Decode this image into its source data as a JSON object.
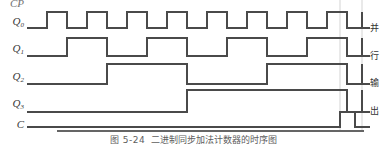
{
  "figure": {
    "caption_number": "图 5-24",
    "caption_text": "二进制同步加法计数器的时序图",
    "background_color": "#ffffff",
    "line_color": "#4a4a4a",
    "guide_color": "#c8c8c8"
  },
  "left_labels": [
    {
      "name": "CP",
      "base": "CP",
      "sub": "",
      "clipped": true
    },
    {
      "name": "Q0",
      "base": "Q",
      "sub": "0",
      "clipped": false
    },
    {
      "name": "Q1",
      "base": "Q",
      "sub": "1",
      "clipped": false
    },
    {
      "name": "Q2",
      "base": "Q",
      "sub": "2",
      "clipped": false
    },
    {
      "name": "Q3",
      "base": "Q",
      "sub": "3",
      "clipped": false
    },
    {
      "name": "C",
      "base": "C",
      "sub": "",
      "clipped": false
    }
  ],
  "right_labels": [
    {
      "text": "并"
    },
    {
      "text": "行"
    },
    {
      "text": "输"
    },
    {
      "text": "出"
    }
  ],
  "chart_data": {
    "type": "line",
    "subtype": "digital-timing-diagram",
    "title": "二进制同步加法计数器的时序图",
    "xlabel": "",
    "ylabel": "",
    "grid": false,
    "legend_position": "right",
    "x_start": 27,
    "x_end": 362,
    "clock_period_px": 40,
    "guide_lines_x": [
      340,
      362
    ],
    "annotations": [
      {
        "text": "并行输出",
        "position": "right",
        "applies_to": [
          "Q0",
          "Q1",
          "Q2",
          "Q3"
        ]
      }
    ],
    "series": [
      {
        "name": "Q0",
        "label": "Q0",
        "row_y_high": 12,
        "row_y_low": 28,
        "description": "LSB, toggles every clock period",
        "transitions_x": [
          27,
          47,
          67,
          87,
          107,
          127,
          147,
          167,
          187,
          207,
          227,
          247,
          267,
          287,
          307,
          327,
          347,
          362
        ],
        "values": [
          0,
          1,
          0,
          1,
          0,
          1,
          0,
          1,
          0,
          1,
          0,
          1,
          0,
          1,
          0,
          1,
          0,
          1
        ]
      },
      {
        "name": "Q1",
        "label": "Q1",
        "row_y_high": 38,
        "row_y_low": 56,
        "description": "toggles every two clock periods",
        "transitions_x": [
          27,
          67,
          107,
          147,
          187,
          227,
          267,
          307,
          347,
          362
        ],
        "values": [
          0,
          1,
          0,
          1,
          0,
          1,
          0,
          1,
          0,
          1
        ]
      },
      {
        "name": "Q2",
        "label": "Q2",
        "row_y_high": 64,
        "row_y_low": 84,
        "description": "toggles every four clock periods",
        "transitions_x": [
          27,
          107,
          187,
          267,
          347,
          362
        ],
        "values": [
          0,
          1,
          0,
          1,
          0,
          1
        ]
      },
      {
        "name": "Q3",
        "label": "Q3",
        "row_y_high": 90,
        "row_y_low": 112,
        "description": "MSB, toggles every eight clock periods",
        "transitions_x": [
          27,
          187,
          347,
          362
        ],
        "values": [
          0,
          1,
          0,
          1
        ]
      },
      {
        "name": "C",
        "label": "C",
        "row_y_high": 112,
        "row_y_low": 127,
        "description": "carry out, single narrow pulse at terminal count",
        "transitions_x": [
          27,
          340,
          355,
          362
        ],
        "values": [
          0,
          1,
          0,
          0
        ]
      }
    ]
  }
}
